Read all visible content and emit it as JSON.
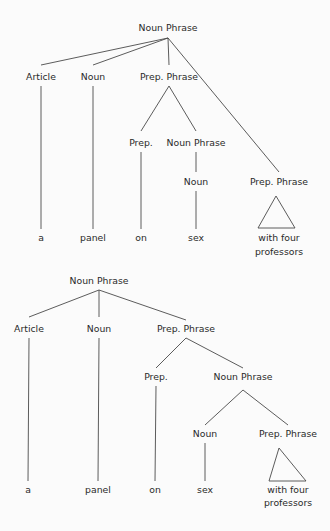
{
  "diagram": {
    "type": "syntax-tree-comparison",
    "trees": [
      {
        "id": "tree-1",
        "nodes": [
          {
            "id": "np",
            "label": "Noun Phrase",
            "x": 168,
            "y": 31,
            "anchor_top": 20,
            "anchor_bottom": 38
          },
          {
            "id": "art",
            "label": "Article",
            "x": 41,
            "y": 80,
            "anchor_top": 65,
            "anchor_bottom": 86
          },
          {
            "id": "n",
            "label": "Noun",
            "x": 93,
            "y": 80,
            "anchor_top": 65,
            "anchor_bottom": 86
          },
          {
            "id": "pp",
            "label": "Prep. Phrase",
            "x": 169,
            "y": 80,
            "anchor_top": 65,
            "anchor_bottom": 86
          },
          {
            "id": "p",
            "label": "Prep.",
            "x": 141,
            "y": 146,
            "anchor_top": 131,
            "anchor_bottom": 152
          },
          {
            "id": "np2",
            "label": "Noun Phrase",
            "x": 196,
            "y": 146,
            "anchor_top": 131,
            "anchor_bottom": 152
          },
          {
            "id": "n2",
            "label": "Noun",
            "x": 196,
            "y": 185,
            "anchor_top": 172,
            "anchor_bottom": 191
          },
          {
            "id": "pp2",
            "label": "Prep. Phrase",
            "x": 279,
            "y": 185,
            "anchor_top": 172,
            "anchor_bottom": 191
          },
          {
            "id": "w_a",
            "label": "a",
            "x": 41,
            "y": 241,
            "anchor_top": 229
          },
          {
            "id": "w_panel",
            "label": "panel",
            "x": 93,
            "y": 241,
            "anchor_top": 229
          },
          {
            "id": "w_on",
            "label": "on",
            "x": 141,
            "y": 241,
            "anchor_top": 229
          },
          {
            "id": "w_sex",
            "label": "sex",
            "x": 196,
            "y": 241,
            "anchor_top": 229
          },
          {
            "id": "w_pp",
            "label": "with four",
            "label2": "professors",
            "x": 279,
            "y": 241,
            "y2": 255
          }
        ],
        "edges": [
          [
            "np",
            "art"
          ],
          [
            "np",
            "n"
          ],
          [
            "np",
            "pp"
          ],
          [
            "np",
            "pp2"
          ],
          [
            "pp",
            "p"
          ],
          [
            "pp",
            "np2"
          ],
          [
            "np2",
            "n2"
          ],
          [
            "art",
            "w_a"
          ],
          [
            "n",
            "w_panel"
          ],
          [
            "p",
            "w_on"
          ],
          [
            "n2",
            "w_sex"
          ]
        ],
        "triangle": {
          "apex": [
            276,
            196
          ],
          "left": [
            258,
            228
          ],
          "right": [
            295,
            228
          ]
        }
      },
      {
        "id": "tree-2",
        "nodes": [
          {
            "id": "np",
            "label": "Noun Phrase",
            "x": 99,
            "y": 284,
            "anchor_top": 272,
            "anchor_bottom": 290
          },
          {
            "id": "art",
            "label": "Article",
            "x": 29,
            "y": 332,
            "anchor_top": 317,
            "anchor_bottom": 338
          },
          {
            "id": "n",
            "label": "Noun",
            "x": 99,
            "y": 332,
            "anchor_top": 317,
            "anchor_bottom": 338
          },
          {
            "id": "pp",
            "label": "Prep. Phrase",
            "x": 186,
            "y": 332,
            "anchor_top": 320,
            "anchor_bottom": 338
          },
          {
            "id": "p",
            "label": "Prep.",
            "x": 156,
            "y": 380,
            "anchor_top": 368,
            "anchor_bottom": 386
          },
          {
            "id": "np2",
            "label": "Noun Phrase",
            "x": 243,
            "y": 380,
            "anchor_top": 368,
            "anchor_bottom": 390
          },
          {
            "id": "n2",
            "label": "Noun",
            "x": 205,
            "y": 437,
            "anchor_top": 425,
            "anchor_bottom": 443
          },
          {
            "id": "pp2",
            "label": "Prep. Phrase",
            "x": 288,
            "y": 437,
            "anchor_top": 425
          },
          {
            "id": "w_a",
            "label": "a",
            "x": 28,
            "y": 493,
            "anchor_top": 481
          },
          {
            "id": "w_panel",
            "label": "panel",
            "x": 98,
            "y": 493,
            "anchor_top": 481
          },
          {
            "id": "w_on",
            "label": "on",
            "x": 155,
            "y": 493,
            "anchor_top": 481
          },
          {
            "id": "w_sex",
            "label": "sex",
            "x": 205,
            "y": 493,
            "anchor_top": 481
          },
          {
            "id": "w_pp",
            "label": "with four",
            "label2": "professors",
            "x": 288,
            "y": 493,
            "y2": 506
          }
        ],
        "edges": [
          [
            "np",
            "art"
          ],
          [
            "np",
            "n"
          ],
          [
            "np",
            "pp"
          ],
          [
            "pp",
            "p"
          ],
          [
            "pp",
            "np2"
          ],
          [
            "np2",
            "n2"
          ],
          [
            "np2",
            "pp2"
          ],
          [
            "art",
            "w_a"
          ],
          [
            "n",
            "w_panel"
          ],
          [
            "p",
            "w_on"
          ],
          [
            "n2",
            "w_sex"
          ]
        ],
        "triangle": {
          "apex": [
            279,
            448
          ],
          "left": [
            269,
            481
          ],
          "right": [
            306,
            481
          ]
        }
      }
    ]
  }
}
